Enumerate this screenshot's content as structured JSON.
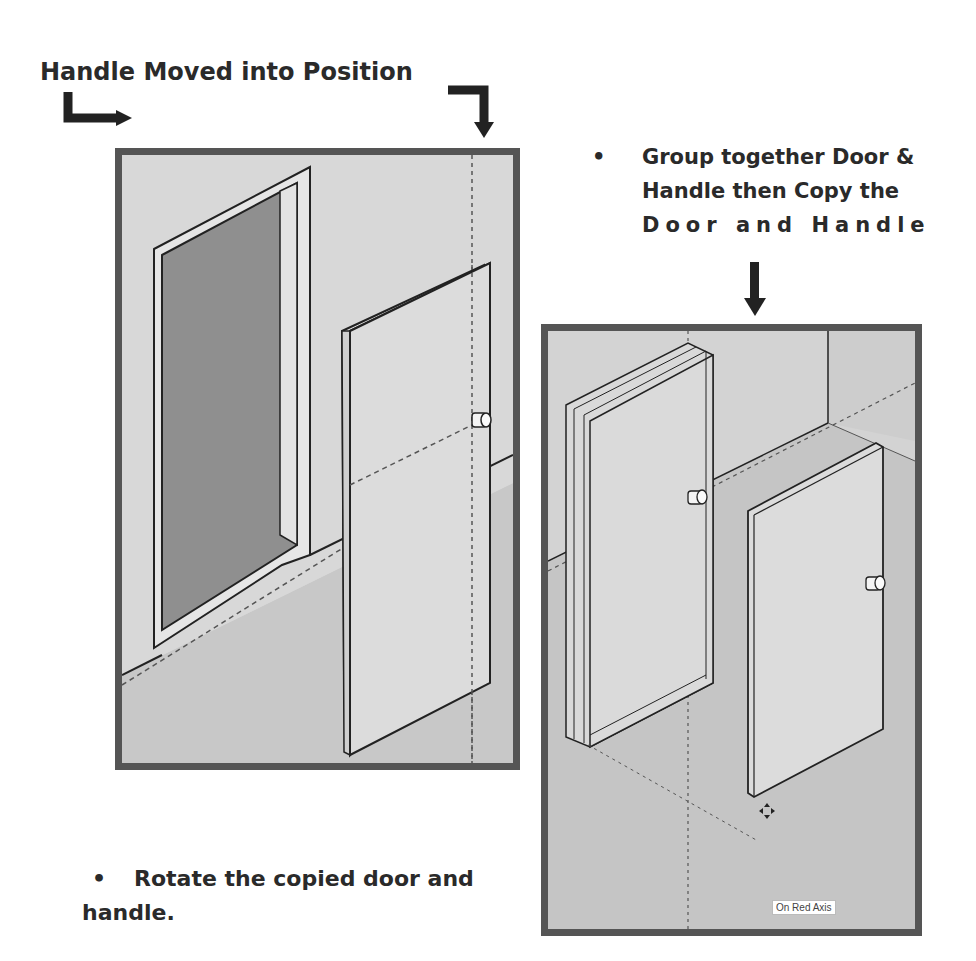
{
  "annotations": {
    "step1_title": "Handle Moved into Position",
    "step2_bullet": "•",
    "step2_lines": [
      "Group together Door &",
      "Handle then Copy the",
      "Door and Handle"
    ],
    "step3_bullet": "•",
    "step3_line1": "Rotate the copied door and",
    "step3_line2": "handle."
  },
  "viewport_left": {
    "objects": [
      "door-frame",
      "door-panel",
      "door-handle",
      "red-axis-inference-line",
      "blue-axis-inference-line"
    ]
  },
  "viewport_right": {
    "objects": [
      "copied-door-group",
      "rotated-door-panel",
      "door-handle",
      "move-cursor"
    ],
    "tooltip": "On Red Axis"
  },
  "colors": {
    "panel_border": "#555555",
    "wall": "#d6d6d6",
    "floor": "#c9c9c9",
    "doorway": "#8e8e8e",
    "door": "#dcdcdc"
  }
}
